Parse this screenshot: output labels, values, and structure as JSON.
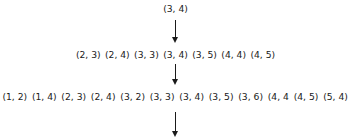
{
  "diagram": {
    "levels": [
      {
        "nodes": [
          "(3, 4)"
        ]
      },
      {
        "nodes": [
          "(2, 3)",
          "(2, 4)",
          "(3, 3)",
          "(3, 4)",
          "(3, 5)",
          "(4, 4)",
          "(4, 5)"
        ]
      },
      {
        "nodes": [
          "(1, 2)",
          "(1, 4)",
          "(2, 3)",
          "(2, 4)",
          "(3, 2)",
          "(3, 3)",
          "(3, 4)",
          "(3, 5)",
          "(3, 6)",
          "(4, 4",
          "(4, 5)",
          "(5, 4)",
          "(5, 6)"
        ]
      }
    ],
    "arrows": [
      {
        "from": "level-1",
        "to": "level-2",
        "direction": "down"
      },
      {
        "from": "level-2",
        "to": "level-3",
        "direction": "down"
      },
      {
        "from": "level-3",
        "to": "next",
        "direction": "down"
      }
    ],
    "colors": {
      "text": "#1a1a1a",
      "arrow": "#1a1a1a",
      "background": "#ffffff"
    }
  }
}
